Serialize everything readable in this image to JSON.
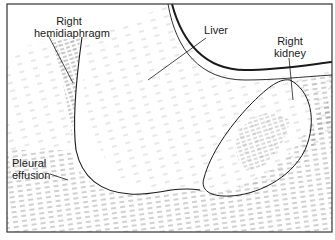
{
  "figure": {
    "type": "ultrasound schematic diagram",
    "colors": {
      "line": "#1a1a1a",
      "hatch": "#8a8a8a",
      "background": "#ffffff",
      "border": "#333333"
    },
    "labels": {
      "right_hemidiaphragm_line1": "Right",
      "right_hemidiaphragm_line2": "hemidiaphragm",
      "liver": "Liver",
      "right_kidney_line1": "Right",
      "right_kidney_line2": "kidney",
      "pleural_effusion_line1": "Pleural",
      "pleural_effusion_line2": "effusion"
    }
  }
}
